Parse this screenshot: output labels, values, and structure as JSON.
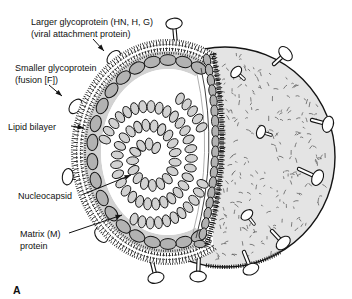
{
  "figure": {
    "letter": "A"
  },
  "labels": {
    "larger_glycoprotein": {
      "line1": "Larger glycoprotein (HN, H, G)",
      "line2": "(viral attachment protein)"
    },
    "smaller_glycoprotein": {
      "line1": "Smaller glycoprotein",
      "line2": "(fusion [F])"
    },
    "lipid_bilayer": "Lipid bilayer",
    "nucleocapsid": "Nucleocapsid",
    "matrix_protein": {
      "line1": "Matrix (M)",
      "line2": "protein"
    }
  },
  "colors": {
    "background": "#ffffff",
    "surface": "#e4e4e4",
    "surface_texture": "#5f5f5f",
    "matrix_oval": "#b2b2b2",
    "matrix_band": "#d2d2d2",
    "bead": "#d2d2d2",
    "outline": "#141414",
    "text": "#111111"
  }
}
